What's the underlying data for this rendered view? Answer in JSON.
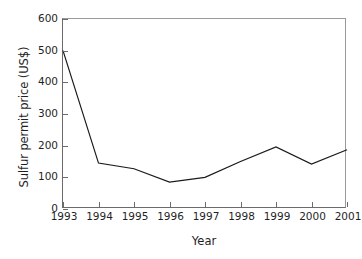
{
  "chart_data": {
    "type": "line",
    "title": "",
    "xlabel": "Year",
    "ylabel": "Sulfur permit price (US$)",
    "x": [
      1993,
      1994,
      1995,
      1996,
      1997,
      1998,
      1999,
      2000,
      2001
    ],
    "xtick_labels": [
      "1993",
      "1994",
      "1995",
      "1996",
      "1997",
      "1998",
      "1999",
      "2000",
      "2001"
    ],
    "values": [
      500,
      145,
      127,
      85,
      100,
      150,
      196,
      142,
      187
    ],
    "series": [
      {
        "name": "Sulfur permit price",
        "values": [
          500,
          145,
          127,
          85,
          100,
          150,
          196,
          142,
          187
        ]
      }
    ],
    "ylim": [
      0,
      600
    ],
    "yticks": [
      0,
      100,
      200,
      300,
      400,
      500,
      600
    ],
    "ytick_labels": [
      "0",
      "100",
      "200",
      "300",
      "400",
      "500",
      "600"
    ],
    "grid": false,
    "legend": false,
    "legend_position": "none",
    "line_color": "#1a1a1a",
    "axis_color": "#6b6b6b",
    "background_color": "#ffffff"
  }
}
